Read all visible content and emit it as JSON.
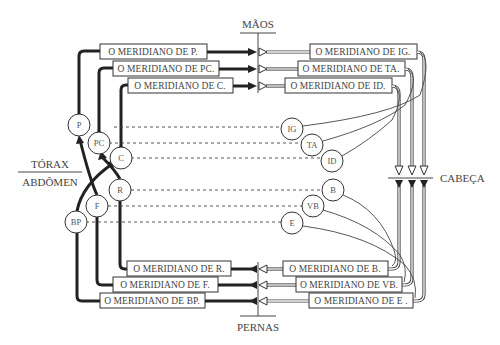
{
  "diagram": {
    "labels": {
      "top": "MÃOS",
      "bottom": "PERNAS",
      "right": "CABEÇA",
      "left_upper": "TÓRAX",
      "left_lower": "ABDÔMEN"
    },
    "meridians_top_left": [
      {
        "label": "O MERIDIANO DE P."
      },
      {
        "label": "O MERIDIANO DE PC."
      },
      {
        "label": "O MERIDIANO DE C."
      }
    ],
    "meridians_top_right": [
      {
        "label": "O MERIDIANO DE IG."
      },
      {
        "label": "O MERIDIANO DE TA."
      },
      {
        "label": "O MERIDIANO DE ID."
      }
    ],
    "meridians_bottom_left": [
      {
        "label": "O MERIDIANO DE R."
      },
      {
        "label": "O MERIDIANO DE F."
      },
      {
        "label": "O MERIDIANO DE BP."
      }
    ],
    "meridians_bottom_right": [
      {
        "label": "O MERIDIANO DE B."
      },
      {
        "label": "O MERIDIANO DE VB."
      },
      {
        "label": "O MERIDIANO DE E ."
      }
    ],
    "nodes_left": [
      {
        "label": "P"
      },
      {
        "label": "PC"
      },
      {
        "label": "C"
      },
      {
        "label": "R"
      },
      {
        "label": "F"
      },
      {
        "label": "BP"
      }
    ],
    "nodes_right": [
      {
        "label": "IG"
      },
      {
        "label": "TA"
      },
      {
        "label": "ID"
      },
      {
        "label": "B"
      },
      {
        "label": "VB"
      },
      {
        "label": "E"
      }
    ]
  }
}
